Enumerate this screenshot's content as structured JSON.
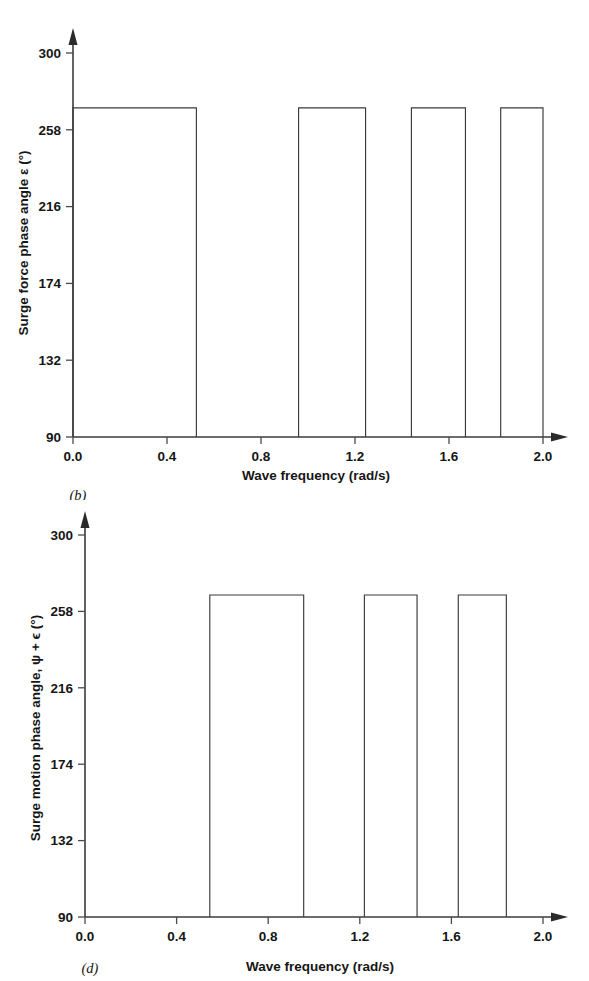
{
  "figure": {
    "panels": [
      {
        "id": "b",
        "panel_label": "(b)",
        "y_axis_title_prefix": "Surge force phase angle ",
        "y_axis_title_symbol": "ε",
        "y_axis_title_suffix": " (°)",
        "x_axis_title": "Wave frequency (rad/s)"
      },
      {
        "id": "d",
        "panel_label": "(d)",
        "y_axis_title_prefix": "Surge motion phase angle, ",
        "y_axis_title_symbol": "ψ + ϵ",
        "y_axis_title_suffix": " (°)",
        "x_axis_title": "Wave frequency (rad/s)"
      }
    ]
  },
  "chart_data": [
    {
      "type": "line",
      "id": "b",
      "title": "",
      "panel_label": "(b)",
      "xlabel": "Wave frequency (rad/s)",
      "ylabel": "Surge force phase angle ε (°)",
      "xlim": [
        0.0,
        2.0
      ],
      "ylim": [
        90,
        300
      ],
      "xticks": [
        0.0,
        0.4,
        0.8,
        1.2,
        1.6,
        2.0
      ],
      "xtick_labels": [
        "0.0",
        "0.4",
        "0.8",
        "1.2",
        "1.6",
        "2.0"
      ],
      "yticks": [
        90,
        132,
        174,
        216,
        258,
        300
      ],
      "ytick_labels": [
        "90",
        "132",
        "174",
        "216",
        "258",
        "300"
      ],
      "grid": false,
      "legend": false,
      "baseline": 90,
      "plateau": 270,
      "segments": [
        {
          "x_start": 0.0,
          "x_end": 0.525,
          "y": 270
        },
        {
          "x_start": 0.96,
          "x_end": 1.245,
          "y": 270
        },
        {
          "x_start": 1.44,
          "x_end": 1.67,
          "y": 270
        },
        {
          "x_start": 1.82,
          "x_end": 2.0,
          "y": 270
        }
      ],
      "points": [
        [
          0.0,
          270
        ],
        [
          0.525,
          270
        ],
        [
          0.525,
          90
        ],
        [
          0.96,
          90
        ],
        [
          0.96,
          270
        ],
        [
          1.245,
          270
        ],
        [
          1.245,
          90
        ],
        [
          1.44,
          90
        ],
        [
          1.44,
          270
        ],
        [
          1.67,
          270
        ],
        [
          1.67,
          90
        ],
        [
          1.82,
          90
        ],
        [
          1.82,
          270
        ],
        [
          2.0,
          270
        ],
        [
          2.0,
          90
        ]
      ]
    },
    {
      "type": "line",
      "id": "d",
      "title": "",
      "panel_label": "(d)",
      "xlabel": "Wave frequency (rad/s)",
      "ylabel": "Surge motion phase angle, ψ + ϵ (°)",
      "xlim": [
        0.0,
        2.0
      ],
      "ylim": [
        90,
        300
      ],
      "xticks": [
        0.0,
        0.4,
        0.8,
        1.2,
        1.6,
        2.0
      ],
      "xtick_labels": [
        "0.0",
        "0.4",
        "0.8",
        "1.2",
        "1.6",
        "2.0"
      ],
      "yticks": [
        90,
        132,
        174,
        216,
        258,
        300
      ],
      "ytick_labels": [
        "90",
        "132",
        "174",
        "216",
        "258",
        "300"
      ],
      "grid": false,
      "legend": false,
      "baseline": 90,
      "plateau": 267,
      "segments": [
        {
          "x_start": 0.545,
          "x_end": 0.955,
          "y": 267
        },
        {
          "x_start": 1.22,
          "x_end": 1.45,
          "y": 267
        },
        {
          "x_start": 1.63,
          "x_end": 1.84,
          "y": 267
        }
      ],
      "points": [
        [
          0.545,
          90
        ],
        [
          0.545,
          267
        ],
        [
          0.955,
          267
        ],
        [
          0.955,
          90
        ],
        [
          1.22,
          90
        ],
        [
          1.22,
          267
        ],
        [
          1.45,
          267
        ],
        [
          1.45,
          90
        ],
        [
          1.63,
          90
        ],
        [
          1.63,
          267
        ],
        [
          1.84,
          267
        ],
        [
          1.84,
          90
        ]
      ]
    }
  ],
  "colors": {
    "background": "#ffffff",
    "axis": "#3b3b3b",
    "series": "#3a3a3a",
    "text": "#161616"
  }
}
